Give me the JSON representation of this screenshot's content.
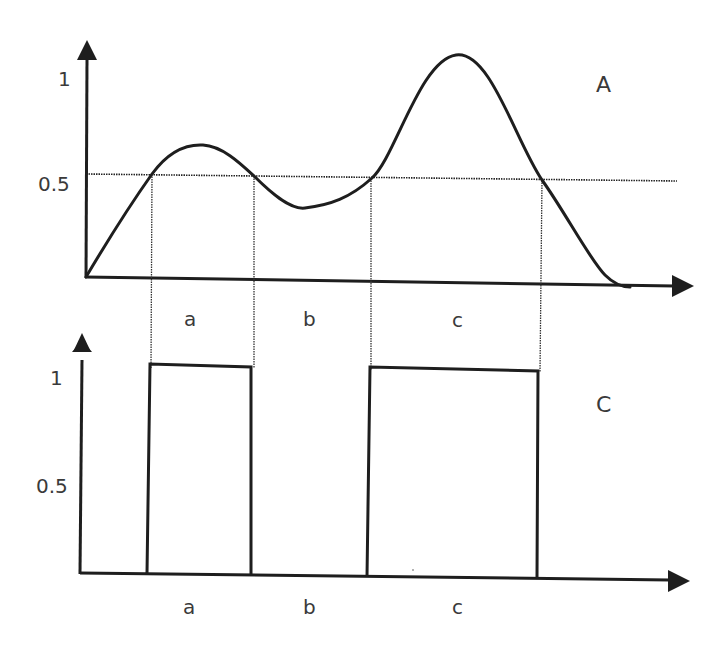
{
  "diagram": {
    "top_panel": {
      "label": "A",
      "y_ticks": [
        "1",
        "0.5"
      ],
      "threshold": 0.5,
      "intervals": [
        "a",
        "b",
        "c"
      ],
      "curve": "smooth signal with two humps; first peak ~0.65, dip ~0.35, second peak ~1.1, returning to 0",
      "crossings_x": [
        152,
        254,
        372,
        542
      ]
    },
    "bottom_panel": {
      "label": "C",
      "y_ticks": [
        "1",
        "0.5"
      ],
      "intervals": [
        "a",
        "b",
        "c"
      ],
      "pulses": [
        {
          "interval": "a",
          "value": 1
        },
        {
          "interval": "b",
          "value": 0
        },
        {
          "interval": "c",
          "value": 1
        }
      ]
    },
    "colors": {
      "line": "#1e1e1e",
      "text": "#3a3a3a",
      "background": "#ffffff"
    }
  }
}
